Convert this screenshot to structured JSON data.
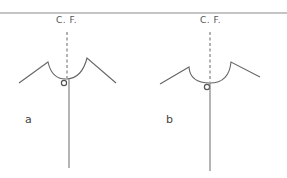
{
  "figures": [
    {
      "id": "a",
      "caption": "a",
      "centerline_label": "C. F."
    },
    {
      "id": "b",
      "caption": "b",
      "centerline_label": "C. F."
    }
  ],
  "colors": {
    "line": "#777777",
    "text": "#555555"
  }
}
